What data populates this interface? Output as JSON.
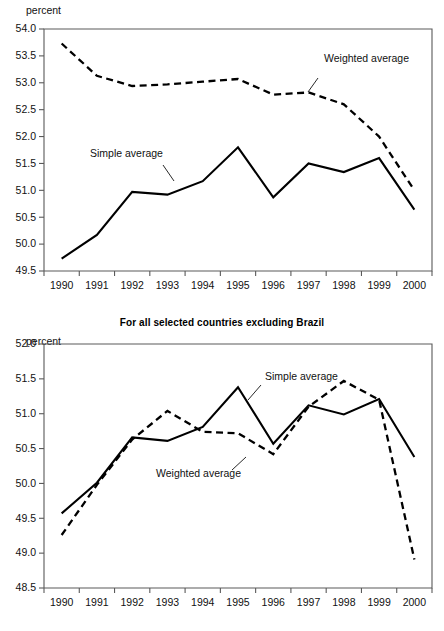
{
  "figure": {
    "unit_label_top": "percent",
    "unit_label_bottom": "percent",
    "bottom_title": "For all selected countries excluding Brazil"
  },
  "annotations": {
    "top_weighted": "Weighted average",
    "top_simple": "Simple average",
    "bottom_simple": "Simple average",
    "bottom_weighted": "Weighted average"
  },
  "chart_data": [
    {
      "type": "line",
      "id": "top",
      "title": "",
      "xlabel": "",
      "ylabel": "percent",
      "grid": false,
      "legend_position": "inline-annotations",
      "x": [
        "1990",
        "1991",
        "1992",
        "1993",
        "1994",
        "1995",
        "1996",
        "1997",
        "1998",
        "1999",
        "2000"
      ],
      "categories": [
        "1990",
        "1991",
        "1992",
        "1993",
        "1994",
        "1995",
        "1996",
        "1997",
        "1998",
        "1999",
        "2000"
      ],
      "ylim": [
        49.5,
        54.0
      ],
      "yticks": [
        "49.5",
        "50.0",
        "50.5",
        "51.0",
        "51.5",
        "52.0",
        "52.5",
        "53.0",
        "53.5",
        "54.0"
      ],
      "series": [
        {
          "name": "Simple average",
          "style": "solid",
          "values": [
            49.73,
            50.17,
            50.97,
            50.92,
            51.17,
            51.8,
            50.87,
            51.5,
            51.34,
            51.6,
            50.64
          ]
        },
        {
          "name": "Weighted average",
          "style": "dashed",
          "values": [
            53.73,
            53.13,
            52.94,
            52.97,
            53.02,
            53.07,
            52.78,
            52.82,
            52.6,
            52.0,
            51.0
          ]
        }
      ]
    },
    {
      "type": "line",
      "id": "bottom",
      "title": "For all selected countries excluding Brazil",
      "xlabel": "",
      "ylabel": "percent",
      "grid": false,
      "legend_position": "inline-annotations",
      "x": [
        "1990",
        "1991",
        "1992",
        "1993",
        "1994",
        "1995",
        "1996",
        "1997",
        "1998",
        "1999",
        "2000"
      ],
      "categories": [
        "1990",
        "1991",
        "1992",
        "1993",
        "1994",
        "1995",
        "1996",
        "1997",
        "1998",
        "1999",
        "2000"
      ],
      "ylim": [
        48.5,
        52.0
      ],
      "yticks": [
        "48.5",
        "49.0",
        "49.5",
        "50.0",
        "50.5",
        "51.0",
        "51.5",
        "52.0"
      ],
      "series": [
        {
          "name": "Simple average",
          "style": "solid",
          "values": [
            49.57,
            50.01,
            50.66,
            50.61,
            50.81,
            51.38,
            50.57,
            51.12,
            50.99,
            51.21,
            50.38
          ]
        },
        {
          "name": "Weighted average",
          "style": "dashed",
          "values": [
            49.26,
            49.98,
            50.63,
            51.04,
            50.74,
            50.72,
            50.42,
            51.1,
            51.47,
            51.2,
            48.91
          ]
        }
      ]
    }
  ]
}
